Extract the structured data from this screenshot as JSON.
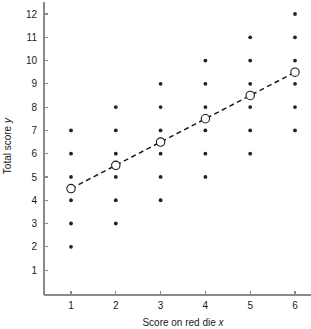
{
  "chart_data": {
    "type": "scatter",
    "title": "",
    "subtitle": "",
    "xlabel": "Score on red die x",
    "ylabel": "Total score y",
    "xlim": [
      0.45,
      6.35
    ],
    "ylim": [
      0.2,
      12.45
    ],
    "xticks": [
      1,
      2,
      3,
      4,
      5,
      6
    ],
    "yticks": [
      1,
      2,
      3,
      4,
      5,
      6,
      7,
      8,
      9,
      10,
      11,
      12
    ],
    "xtick_labels": [
      "1",
      "2",
      "3",
      "4",
      "5",
      "6"
    ],
    "ytick_labels": [
      "1",
      "2",
      "3",
      "4",
      "5",
      "6",
      "7",
      "8",
      "9",
      "10",
      "11",
      "12"
    ],
    "grid": false,
    "legend": null,
    "legend_position": "none",
    "series": [
      {
        "name": "Sample outcomes",
        "marker": "filled-dot",
        "color": "#222222",
        "points": [
          {
            "x": 1,
            "y": 2
          },
          {
            "x": 1,
            "y": 3
          },
          {
            "x": 1,
            "y": 4
          },
          {
            "x": 1,
            "y": 5
          },
          {
            "x": 1,
            "y": 6
          },
          {
            "x": 1,
            "y": 7
          },
          {
            "x": 2,
            "y": 3
          },
          {
            "x": 2,
            "y": 4
          },
          {
            "x": 2,
            "y": 5
          },
          {
            "x": 2,
            "y": 6
          },
          {
            "x": 2,
            "y": 7
          },
          {
            "x": 2,
            "y": 8
          },
          {
            "x": 3,
            "y": 4
          },
          {
            "x": 3,
            "y": 5
          },
          {
            "x": 3,
            "y": 6
          },
          {
            "x": 3,
            "y": 7
          },
          {
            "x": 3,
            "y": 8
          },
          {
            "x": 3,
            "y": 9
          },
          {
            "x": 4,
            "y": 5
          },
          {
            "x": 4,
            "y": 6
          },
          {
            "x": 4,
            "y": 7
          },
          {
            "x": 4,
            "y": 8
          },
          {
            "x": 4,
            "y": 9
          },
          {
            "x": 4,
            "y": 10
          },
          {
            "x": 5,
            "y": 6
          },
          {
            "x": 5,
            "y": 7
          },
          {
            "x": 5,
            "y": 8
          },
          {
            "x": 5,
            "y": 9
          },
          {
            "x": 5,
            "y": 10
          },
          {
            "x": 5,
            "y": 11
          },
          {
            "x": 6,
            "y": 7
          },
          {
            "x": 6,
            "y": 8
          },
          {
            "x": 6,
            "y": 9
          },
          {
            "x": 6,
            "y": 10
          },
          {
            "x": 6,
            "y": 11
          },
          {
            "x": 6,
            "y": 12
          }
        ]
      },
      {
        "name": "Conditional means",
        "marker": "open-circle",
        "color": "#1a1a1a",
        "points": [
          {
            "x": 1,
            "y": 4.5
          },
          {
            "x": 2,
            "y": 5.5
          },
          {
            "x": 3,
            "y": 6.5
          },
          {
            "x": 4,
            "y": 7.5
          },
          {
            "x": 5,
            "y": 8.5
          },
          {
            "x": 6,
            "y": 9.5
          }
        ]
      }
    ],
    "lines": [
      {
        "name": "regression-line",
        "style": "dashed",
        "color": "#1a1a1a",
        "from": {
          "x": 1,
          "y": 4.5
        },
        "to": {
          "x": 6,
          "y": 9.5
        }
      }
    ]
  }
}
